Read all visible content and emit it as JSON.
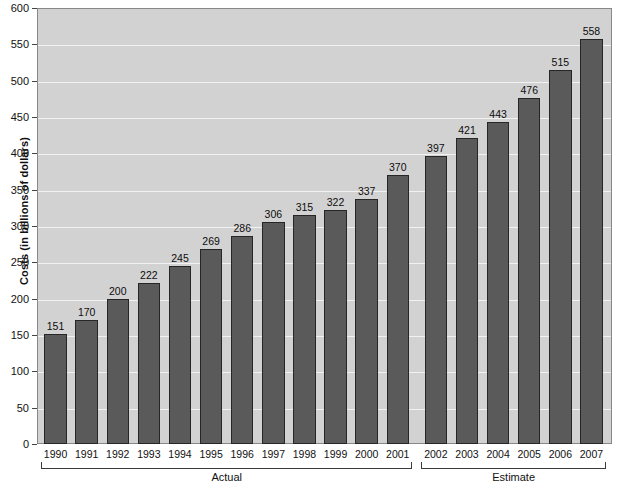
{
  "chart_data": {
    "type": "bar",
    "title": "",
    "xlabel": "",
    "ylabel": "Costs (in billions of dollars)",
    "ylim": [
      0,
      600
    ],
    "ytick_step": 50,
    "yticks": [
      0,
      50,
      100,
      150,
      200,
      250,
      300,
      350,
      400,
      450,
      500,
      550,
      600
    ],
    "grid": true,
    "legend": "none",
    "categories": [
      "1990",
      "1991",
      "1992",
      "1993",
      "1994",
      "1995",
      "1996",
      "1997",
      "1998",
      "1999",
      "2000",
      "2001",
      "2002",
      "2003",
      "2004",
      "2005",
      "2006",
      "2007"
    ],
    "values": [
      151,
      170,
      200,
      222,
      245,
      269,
      286,
      306,
      315,
      322,
      337,
      370,
      397,
      421,
      443,
      476,
      515,
      558
    ],
    "value_labels": [
      "151",
      "170",
      "200",
      "222",
      "245",
      "269",
      "286",
      "306",
      "315",
      "322",
      "337",
      "370",
      "397",
      "421",
      "443",
      "476",
      "515",
      "558"
    ],
    "groups": [
      {
        "label": "Actual",
        "start_index": 0,
        "end_index": 11
      },
      {
        "label": "Estimate",
        "start_index": 12,
        "end_index": 17
      }
    ],
    "colors": {
      "bar_fill": "#5a5a5a",
      "bar_stroke": "#262626",
      "plot_background": "#d2d2d2",
      "gridline": "#f2f2f2",
      "plot_border": "#888888",
      "text": "#111111"
    }
  }
}
